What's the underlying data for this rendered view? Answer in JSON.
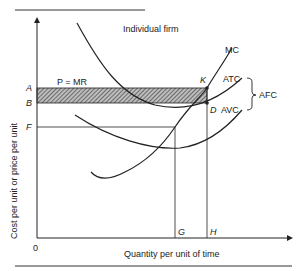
{
  "title": "Individual firm",
  "axes": {
    "x_label": "Quantity per unit of time",
    "y_label": "Cost per unit or price per unit",
    "origin": "0"
  },
  "price_levels": {
    "A": "A",
    "B": "B",
    "F": "F"
  },
  "quantity_levels": {
    "G": "G",
    "H": "H"
  },
  "lines": {
    "price_line": "P = MR"
  },
  "curves": {
    "mc": "MC",
    "atc": "ATC",
    "avc": "AVC",
    "afc": "AFC"
  },
  "points": {
    "K": "K",
    "D": "D"
  },
  "colors": {
    "ink": "#222222",
    "background": "#ffffff"
  }
}
